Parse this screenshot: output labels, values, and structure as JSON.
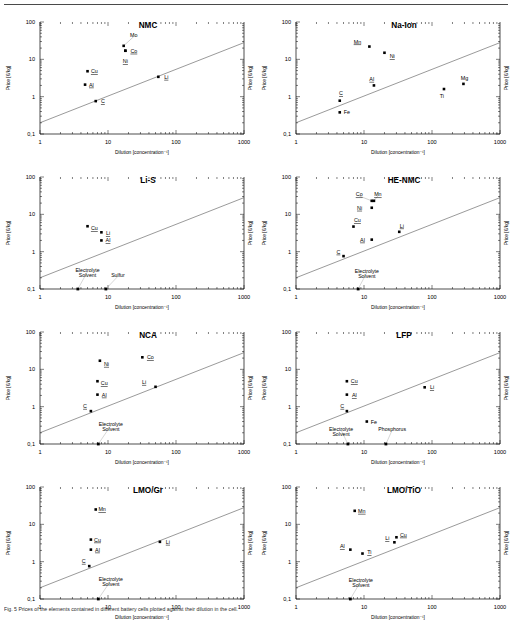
{
  "figure": {
    "axis": {
      "xlabel": "Dilution [concentration⁻¹]",
      "ylabel": "Price [€/kg]",
      "xticks": [
        "1",
        "10",
        "100",
        "1000"
      ],
      "yticks": [
        "100",
        "10",
        "1",
        "0,1"
      ],
      "xlim": [
        1,
        1000
      ],
      "ylim": [
        0.1,
        100
      ],
      "grid": false,
      "reference_line": {
        "x": [
          1,
          1000
        ],
        "y": [
          0.2,
          28
        ]
      }
    },
    "caption": "Fig. 5  Prices of the elements contained in different battery cells plotted against their dilution in the cell."
  },
  "chart_data": [
    {
      "type": "scatter",
      "title": "NMC",
      "xlabel": "Dilution [concentration⁻¹]",
      "ylabel": "Price [€/kg]",
      "xlim": [
        1,
        1000
      ],
      "ylim": [
        0.1,
        100
      ],
      "points": [
        {
          "label": "Mo",
          "x": 17,
          "y": 23,
          "lx": 24,
          "ly": 45,
          "underline": false,
          "leader": true
        },
        {
          "label": "Co",
          "x": 18,
          "y": 17,
          "lx": 24,
          "ly": 17,
          "underline": true,
          "leader": false
        },
        {
          "label": "Ni",
          "x": 18,
          "y": 17,
          "lx": 18,
          "ly": 9.0,
          "underline": true,
          "leader": false
        },
        {
          "label": "Cu",
          "x": 5.0,
          "y": 4.8,
          "lx": 6.3,
          "ly": 4.8,
          "underline": true,
          "leader": false
        },
        {
          "label": "Al",
          "x": 4.6,
          "y": 2.1,
          "lx": 5.7,
          "ly": 2.1,
          "underline": true,
          "leader": false
        },
        {
          "label": "Li",
          "x": 55,
          "y": 3.4,
          "lx": 72,
          "ly": 3.4,
          "underline": true,
          "leader": false
        },
        {
          "label": "C",
          "x": 6.6,
          "y": 0.76,
          "lx": 8.4,
          "ly": 0.76,
          "underline": true,
          "leader": false
        }
      ],
      "annotations": []
    },
    {
      "type": "scatter",
      "title": "Na-Ion",
      "xlabel": "Dilution [concentration⁻¹]",
      "ylabel": "Price [€/kg]",
      "xlim": [
        1,
        1000
      ],
      "ylim": [
        0.1,
        100
      ],
      "points": [
        {
          "label": "Mn",
          "x": 12,
          "y": 22,
          "lx": 8.0,
          "ly": 30,
          "underline": true,
          "leader": false
        },
        {
          "label": "Ni",
          "x": 20,
          "y": 15,
          "lx": 26,
          "ly": 12,
          "underline": true,
          "leader": false
        },
        {
          "label": "Al",
          "x": 14,
          "y": 2.0,
          "lx": 13,
          "ly": 3.0,
          "underline": true,
          "leader": false
        },
        {
          "label": "Mg",
          "x": 290,
          "y": 2.2,
          "lx": 300,
          "ly": 3.1,
          "underline": false,
          "leader": false
        },
        {
          "label": "Ti",
          "x": 150,
          "y": 1.6,
          "lx": 140,
          "ly": 1.05,
          "underline": false,
          "leader": false
        },
        {
          "label": "C",
          "x": 4.4,
          "y": 0.78,
          "lx": 4.6,
          "ly": 1.25,
          "underline": true,
          "leader": false
        },
        {
          "label": "Fe",
          "x": 4.4,
          "y": 0.38,
          "lx": 5.6,
          "ly": 0.38,
          "underline": false,
          "leader": false
        }
      ],
      "annotations": []
    },
    {
      "type": "scatter",
      "title": "Li-S",
      "xlabel": "Dilution [concentration⁻¹]",
      "ylabel": "Price [€/kg]",
      "xlim": [
        1,
        1000
      ],
      "ylim": [
        0.1,
        100
      ],
      "points": [
        {
          "label": "Cu",
          "x": 5.0,
          "y": 4.8,
          "lx": 6.3,
          "ly": 4.3,
          "underline": true,
          "leader": false
        },
        {
          "label": "Li",
          "x": 8.0,
          "y": 3.3,
          "lx": 10,
          "ly": 3.1,
          "underline": true,
          "leader": false
        },
        {
          "label": "Al",
          "x": 8.0,
          "y": 2.0,
          "lx": 10,
          "ly": 2.0,
          "underline": true,
          "leader": false
        }
      ],
      "annotations": [
        {
          "label": "Electrolyte",
          "x": 3.6,
          "y": 0.1,
          "tx": 5.0,
          "ty": 0.32,
          "marker": true,
          "leader": true
        },
        {
          "label": "Solvent",
          "x": 3.6,
          "y": 0.1,
          "tx": 5.0,
          "ty": 0.24,
          "marker": false,
          "leader": false
        },
        {
          "label": "Sulfur",
          "x": 9.3,
          "y": 0.1,
          "tx": 14,
          "ty": 0.24,
          "marker": true,
          "leader": true
        }
      ]
    },
    {
      "type": "scatter",
      "title": "HE-NMC",
      "xlabel": "Dilution [concentration⁻¹]",
      "ylabel": "Price [€/kg]",
      "xlim": [
        1,
        1000
      ],
      "ylim": [
        0.1,
        100
      ],
      "points": [
        {
          "label": "Co",
          "x": 13,
          "y": 23,
          "lx": 8.5,
          "ly": 34,
          "underline": true,
          "leader": true
        },
        {
          "label": "Mn",
          "x": 14,
          "y": 23,
          "lx": 16,
          "ly": 34,
          "underline": true,
          "leader": true
        },
        {
          "label": "Ni",
          "x": 13,
          "y": 15,
          "lx": 8.6,
          "ly": 15,
          "underline": true,
          "leader": false
        },
        {
          "label": "Cu",
          "x": 7.0,
          "y": 4.7,
          "lx": 8.0,
          "ly": 7.0,
          "underline": true,
          "leader": false
        },
        {
          "label": "Li",
          "x": 33,
          "y": 3.4,
          "lx": 36,
          "ly": 5.0,
          "underline": true,
          "leader": false
        },
        {
          "label": "Al",
          "x": 13,
          "y": 2.1,
          "lx": 9.5,
          "ly": 2.1,
          "underline": true,
          "leader": false
        },
        {
          "label": "C",
          "x": 5.0,
          "y": 0.76,
          "lx": 4.2,
          "ly": 1.0,
          "underline": true,
          "leader": false
        }
      ],
      "annotations": [
        {
          "label": "Electrolyte",
          "x": 8.2,
          "y": 0.1,
          "tx": 11,
          "ty": 0.3,
          "marker": true,
          "leader": true
        },
        {
          "label": "Solvent",
          "x": 8.2,
          "y": 0.1,
          "tx": 11,
          "ty": 0.22,
          "marker": false,
          "leader": false
        }
      ]
    },
    {
      "type": "scatter",
      "title": "NCA",
      "xlabel": "Dilution [concentration⁻¹]",
      "ylabel": "Price [€/kg]",
      "xlim": [
        1,
        1000
      ],
      "ylim": [
        0.1,
        100
      ],
      "points": [
        {
          "label": "Ni",
          "x": 7.6,
          "y": 17,
          "lx": 9.5,
          "ly": 14,
          "underline": true,
          "leader": false
        },
        {
          "label": "Co",
          "x": 32,
          "y": 21,
          "lx": 42,
          "ly": 21,
          "underline": true,
          "leader": false
        },
        {
          "label": "Cu",
          "x": 7.0,
          "y": 4.8,
          "lx": 8.8,
          "ly": 4.3,
          "underline": true,
          "leader": false
        },
        {
          "label": "Li",
          "x": 50,
          "y": 3.4,
          "lx": 34,
          "ly": 4.6,
          "underline": true,
          "leader": false
        },
        {
          "label": "Al",
          "x": 7.0,
          "y": 2.1,
          "lx": 8.8,
          "ly": 2.1,
          "underline": true,
          "leader": false
        },
        {
          "label": "C",
          "x": 5.6,
          "y": 0.76,
          "lx": 4.6,
          "ly": 1.05,
          "underline": true,
          "leader": false
        }
      ],
      "annotations": [
        {
          "label": "Electrolyte",
          "x": 7.2,
          "y": 0.1,
          "tx": 11,
          "ty": 0.34,
          "marker": true,
          "leader": true
        },
        {
          "label": "Solvent",
          "x": 7.2,
          "y": 0.1,
          "tx": 11,
          "ty": 0.25,
          "marker": false,
          "leader": false
        }
      ]
    },
    {
      "type": "scatter",
      "title": "LFP",
      "xlabel": "Dilution [concentration⁻¹]",
      "ylabel": "Price [€/kg]",
      "xlim": [
        1,
        1000
      ],
      "ylim": [
        0.1,
        100
      ],
      "points": [
        {
          "label": "Cu",
          "x": 5.6,
          "y": 4.8,
          "lx": 7.2,
          "ly": 4.8,
          "underline": true,
          "leader": false
        },
        {
          "label": "Al",
          "x": 5.6,
          "y": 2.1,
          "lx": 7.2,
          "ly": 2.0,
          "underline": true,
          "leader": false
        },
        {
          "label": "Li",
          "x": 78,
          "y": 3.3,
          "lx": 100,
          "ly": 3.3,
          "underline": true,
          "leader": false
        },
        {
          "label": "C",
          "x": 5.6,
          "y": 0.76,
          "lx": 4.8,
          "ly": 1.05,
          "underline": true,
          "leader": false
        },
        {
          "label": "Fe",
          "x": 11,
          "y": 0.4,
          "lx": 14,
          "ly": 0.4,
          "underline": false,
          "leader": false
        }
      ],
      "annotations": [
        {
          "label": "Electrolyte",
          "x": 5.8,
          "y": 0.1,
          "tx": 4.6,
          "ty": 0.26,
          "marker": true,
          "leader": true
        },
        {
          "label": "Solvent",
          "x": 5.8,
          "y": 0.1,
          "tx": 4.6,
          "ty": 0.19,
          "marker": false,
          "leader": false
        },
        {
          "label": "Phosphorus",
          "x": 21,
          "y": 0.1,
          "tx": 26,
          "ty": 0.26,
          "marker": true,
          "leader": true
        }
      ]
    },
    {
      "type": "scatter",
      "title": "LMO/Gr",
      "xlabel": "Dilution [concentration⁻¹]",
      "ylabel": "Price [€/kg]",
      "xlim": [
        1,
        1000
      ],
      "ylim": [
        0.1,
        100
      ],
      "points": [
        {
          "label": "Mn",
          "x": 6.6,
          "y": 25,
          "lx": 8.2,
          "ly": 25,
          "underline": true,
          "leader": false
        },
        {
          "label": "Cu",
          "x": 5.6,
          "y": 3.9,
          "lx": 7.0,
          "ly": 3.9,
          "underline": true,
          "leader": false
        },
        {
          "label": "Al",
          "x": 5.6,
          "y": 2.1,
          "lx": 7.0,
          "ly": 2.1,
          "underline": true,
          "leader": false
        },
        {
          "label": "Li",
          "x": 58,
          "y": 3.4,
          "lx": 76,
          "ly": 3.4,
          "underline": true,
          "leader": false
        },
        {
          "label": "C",
          "x": 5.3,
          "y": 0.76,
          "lx": 4.4,
          "ly": 1.05,
          "underline": true,
          "leader": false
        }
      ],
      "annotations": [
        {
          "label": "Electrolyte",
          "x": 7.2,
          "y": 0.1,
          "tx": 11,
          "ty": 0.34,
          "marker": true,
          "leader": true
        },
        {
          "label": "Solvent",
          "x": 7.2,
          "y": 0.1,
          "tx": 11,
          "ty": 0.25,
          "marker": false,
          "leader": false
        }
      ]
    },
    {
      "type": "scatter",
      "title": "LMO/TiO",
      "xlabel": "Dilution [concentration⁻¹]",
      "ylabel": "Price [€/kg]",
      "xlim": [
        1,
        1000
      ],
      "ylim": [
        0.1,
        100
      ],
      "points": [
        {
          "label": "Mn",
          "x": 7.3,
          "y": 23,
          "lx": 9.3,
          "ly": 23,
          "underline": true,
          "leader": false
        },
        {
          "label": "Cu",
          "x": 30,
          "y": 4.5,
          "lx": 38,
          "ly": 5.3,
          "underline": true,
          "leader": false
        },
        {
          "label": "Li",
          "x": 28,
          "y": 3.3,
          "lx": 22,
          "ly": 4.3,
          "underline": true,
          "leader": false
        },
        {
          "label": "Al",
          "x": 6.3,
          "y": 2.1,
          "lx": 4.8,
          "ly": 2.6,
          "underline": true,
          "leader": false
        },
        {
          "label": "Ti",
          "x": 9.5,
          "y": 1.65,
          "lx": 12,
          "ly": 1.8,
          "underline": true,
          "leader": false
        }
      ],
      "annotations": [
        {
          "label": "Electrolyte",
          "x": 6.3,
          "y": 0.1,
          "tx": 9.0,
          "ty": 0.33,
          "marker": true,
          "leader": true
        },
        {
          "label": "Solvent",
          "x": 6.3,
          "y": 0.1,
          "tx": 9.0,
          "ty": 0.24,
          "marker": false,
          "leader": false
        }
      ]
    }
  ]
}
